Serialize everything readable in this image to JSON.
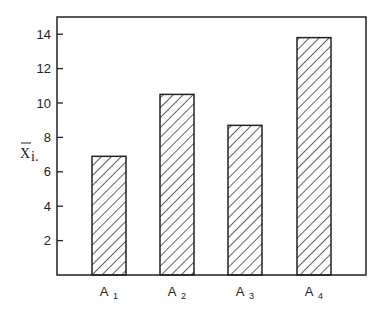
{
  "chart_data": {
    "type": "bar",
    "title": "",
    "xlabel": "",
    "ylabel": "X̄i.",
    "ylabel_main": "X",
    "ylabel_sub": "i.",
    "categories": [
      "A1",
      "A2",
      "A3",
      "A4"
    ],
    "category_labels": [
      {
        "main": "A",
        "sub": "1"
      },
      {
        "main": "A",
        "sub": "2"
      },
      {
        "main": "A",
        "sub": "3"
      },
      {
        "main": "A",
        "sub": "4"
      }
    ],
    "values": [
      6.9,
      10.5,
      8.7,
      13.8
    ],
    "ylim": [
      0,
      15
    ],
    "yticks": [
      2,
      4,
      6,
      8,
      10,
      12,
      14
    ],
    "grid": false,
    "legend": null,
    "bar_fill": "diagonal-hatch",
    "colors": {
      "line": "#222222",
      "background": "#ffffff"
    }
  }
}
